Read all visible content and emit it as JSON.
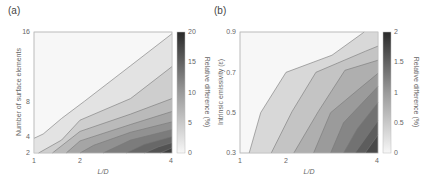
{
  "chart_data": [
    {
      "type": "contour",
      "panel_label": "(a)",
      "xlabel": "L/D",
      "ylabel": "Number of surface elements",
      "xlim": [
        1,
        4
      ],
      "ylim": [
        2,
        16
      ],
      "xticks": [
        "1",
        "2",
        "4"
      ],
      "xtick_values": [
        1,
        2,
        4
      ],
      "yticks": [
        "2",
        "4",
        "8",
        "16"
      ],
      "ytick_values": [
        2,
        4,
        8,
        16
      ],
      "colorbar": {
        "label": "Relative difference (%)",
        "min": 0,
        "max": 20,
        "ticks": [
          "0",
          "5",
          "10",
          "15",
          "20"
        ],
        "tick_values": [
          0,
          5,
          10,
          15,
          20
        ]
      },
      "description": "Relative difference increases with L/D and decreases with number of surface elements; maximum (~20%) at L/D=4, 2 elements",
      "contour_lines": [
        {
          "level": 1,
          "points": [
            [
              1.0,
              3.7
            ],
            [
              1.2,
              4.2
            ],
            [
              1.6,
              6.0
            ],
            [
              2.0,
              7.6
            ],
            [
              2.1,
              8.0
            ],
            [
              3.1,
              12.1
            ],
            [
              4.0,
              15.8
            ]
          ]
        },
        {
          "level": 3,
          "points": [
            [
              1.1,
              2.0
            ],
            [
              1.6,
              3.5
            ],
            [
              2.0,
              5.8
            ],
            [
              3.1,
              8.3
            ],
            [
              4.0,
              12.0
            ]
          ]
        },
        {
          "level": 5,
          "points": [
            [
              1.4,
              2.0
            ],
            [
              2.0,
              4.5
            ],
            [
              3.1,
              6.5
            ],
            [
              4.0,
              8.3
            ]
          ]
        },
        {
          "level": 7,
          "points": [
            [
              1.7,
              2.0
            ],
            [
              2.0,
              3.4
            ],
            [
              3.1,
              5.3
            ],
            [
              4.0,
              6.8
            ]
          ]
        },
        {
          "level": 9,
          "points": [
            [
              2.0,
              2.0
            ],
            [
              2.3,
              2.9
            ],
            [
              3.1,
              4.4
            ],
            [
              4.0,
              5.6
            ]
          ]
        },
        {
          "level": 11,
          "points": [
            [
              2.5,
              2.0
            ],
            [
              3.1,
              3.5
            ],
            [
              4.0,
              4.7
            ]
          ]
        },
        {
          "level": 13,
          "points": [
            [
              3.0,
              2.0
            ],
            [
              3.4,
              3.0
            ],
            [
              4.0,
              3.9
            ]
          ]
        },
        {
          "level": 15,
          "points": [
            [
              3.4,
              2.0
            ],
            [
              3.7,
              2.7
            ],
            [
              4.0,
              3.2
            ]
          ]
        },
        {
          "level": 17,
          "points": [
            [
              3.75,
              2.0
            ],
            [
              4.0,
              2.6
            ]
          ]
        }
      ]
    },
    {
      "type": "contour",
      "panel_label": "(b)",
      "xlabel": "L/D",
      "ylabel": "Intrinsic emissivity (ε)",
      "xlim": [
        1,
        4
      ],
      "ylim": [
        0.3,
        0.9
      ],
      "xticks": [
        "1",
        "2",
        "4"
      ],
      "xtick_values": [
        1,
        2,
        4
      ],
      "yticks": [
        "0.3",
        "0.5",
        "0.7",
        "0.9"
      ],
      "ytick_values": [
        0.3,
        0.5,
        0.7,
        0.9
      ],
      "colorbar": {
        "label": "Relative difference (%)",
        "min": 0,
        "max": 2,
        "ticks": [
          "0",
          "0.5",
          "1",
          "1.5",
          "2"
        ],
        "tick_values": [
          0,
          0.5,
          1,
          1.5,
          2
        ]
      },
      "description": "Relative difference increases with L/D and decreases with intrinsic emissivity; maximum (~2%) at L/D=4, emissivity 0.3",
      "contour_lines": [
        {
          "level": 0.2,
          "points": [
            [
              1.2,
              0.3
            ],
            [
              1.45,
              0.5
            ],
            [
              2.0,
              0.7
            ],
            [
              3.0,
              0.785
            ],
            [
              3.7,
              0.9
            ]
          ]
        },
        {
          "level": 0.4,
          "points": [
            [
              1.68,
              0.3
            ],
            [
              2.13,
              0.505
            ],
            [
              2.65,
              0.7
            ],
            [
              3.73,
              0.805
            ],
            [
              4.0,
              0.83
            ]
          ]
        },
        {
          "level": 0.6,
          "points": [
            [
              2.17,
              0.3
            ],
            [
              2.7,
              0.505
            ],
            [
              3.28,
              0.71
            ],
            [
              4.0,
              0.76
            ]
          ]
        },
        {
          "level": 0.8,
          "points": [
            [
              2.6,
              0.3
            ],
            [
              2.97,
              0.5
            ],
            [
              3.6,
              0.62
            ],
            [
              4.0,
              0.695
            ]
          ]
        },
        {
          "level": 1.0,
          "points": [
            [
              2.97,
              0.3
            ],
            [
              3.25,
              0.45
            ],
            [
              4.0,
              0.63
            ]
          ]
        },
        {
          "level": 1.2,
          "points": [
            [
              3.25,
              0.3
            ],
            [
              3.55,
              0.42
            ],
            [
              4.0,
              0.55
            ]
          ]
        },
        {
          "level": 1.4,
          "points": [
            [
              3.5,
              0.3
            ],
            [
              4.0,
              0.46
            ]
          ]
        },
        {
          "level": 1.6,
          "points": [
            [
              3.72,
              0.3
            ],
            [
              4.0,
              0.39
            ]
          ]
        }
      ]
    }
  ]
}
